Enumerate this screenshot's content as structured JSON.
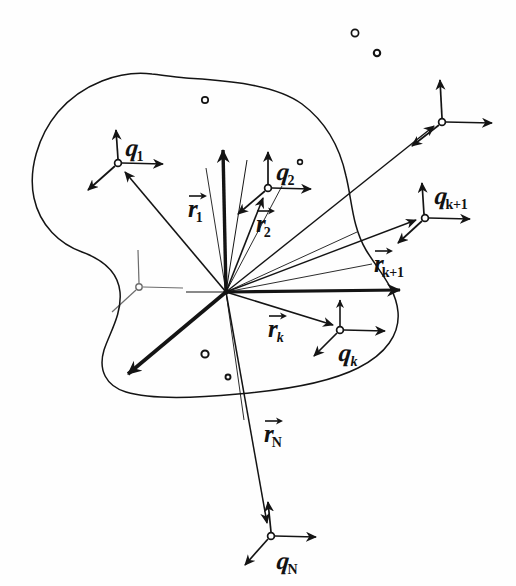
{
  "figure": {
    "type": "hand-drawn-diagram",
    "ink_color": "#141414",
    "paper_color": "#fefefe"
  },
  "labels": {
    "q1": {
      "symbol": "q",
      "subscript": "1"
    },
    "q2": {
      "symbol": "q",
      "subscript": "2"
    },
    "qk": {
      "symbol": "q",
      "subscript": "k"
    },
    "qk1": {
      "symbol": "q",
      "subscript": "k+1"
    },
    "qN": {
      "symbol": "q",
      "subscript": "N"
    },
    "r1": {
      "symbol": "r",
      "subscript": "1"
    },
    "r2": {
      "symbol": "r",
      "subscript": "2"
    },
    "rk": {
      "symbol": "r",
      "subscript": "k"
    },
    "rk1": {
      "symbol": "r",
      "subscript": "k+1"
    },
    "rN": {
      "symbol": "r",
      "subscript": "N"
    }
  },
  "origin": {
    "x": 226,
    "y": 292
  },
  "frames": [
    {
      "name": "frame-q1",
      "x": 118,
      "y": 163,
      "label": "q1",
      "labelled": true
    },
    {
      "name": "frame-q2",
      "x": 268,
      "y": 188,
      "label": "q2",
      "labelled": true
    },
    {
      "name": "frame-qk",
      "x": 340,
      "y": 330,
      "label": "qk",
      "labelled": true
    },
    {
      "name": "frame-qk1",
      "x": 425,
      "y": 218,
      "label": "qk1",
      "labelled": true
    },
    {
      "name": "frame-qN",
      "x": 271,
      "y": 536,
      "label": "qN",
      "labelled": true
    },
    {
      "name": "frame-corner",
      "x": 442,
      "y": 122,
      "label": "",
      "labelled": false
    },
    {
      "name": "frame-interior",
      "x": 139,
      "y": 287,
      "label": "",
      "labelled": false
    }
  ],
  "vectors": [
    {
      "name": "vector-r1",
      "label": "r1",
      "to_frame": "frame-q1"
    },
    {
      "name": "vector-r2",
      "label": "r2",
      "to_frame": "frame-q2"
    },
    {
      "name": "vector-rk",
      "label": "rk",
      "to_frame": "frame-qk"
    },
    {
      "name": "vector-rk1",
      "label": "rk1",
      "to_frame": "frame-qk1"
    },
    {
      "name": "vector-rN",
      "label": "rN",
      "to_frame": "frame-qN"
    }
  ],
  "particles": [
    {
      "x": 355,
      "y": 33
    },
    {
      "x": 377,
      "y": 53
    },
    {
      "x": 205,
      "y": 100
    },
    {
      "x": 205,
      "y": 354
    },
    {
      "x": 228,
      "y": 377
    },
    {
      "x": 300,
      "y": 162
    }
  ]
}
